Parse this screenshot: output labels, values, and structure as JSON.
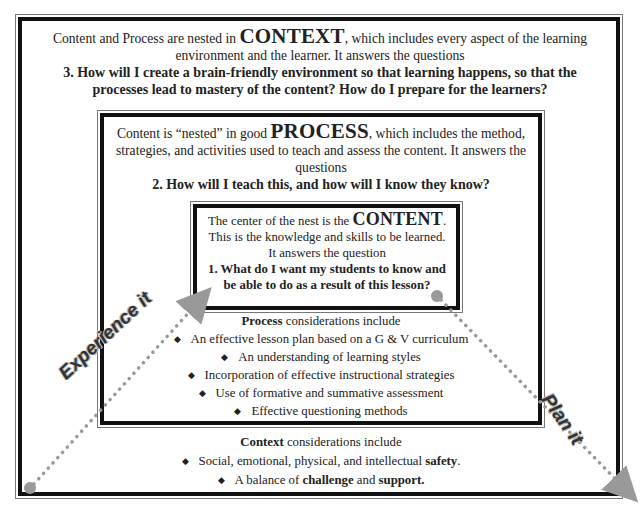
{
  "context_box": {
    "intro_pre": "Content and Process are nested in ",
    "keyword": "CONTEXT",
    "intro_post": ", which includes every aspect of the learning environment and the learner. It answers the questions",
    "question": "3. How will I create a brain-friendly environment so that learning happens, so that the processes lead to mastery of the content? How do I prepare for the learners?",
    "considerations_keyword": "Context",
    "considerations_label": " considerations include",
    "items": [
      {
        "pre": "Social, emotional, physical, and intellectual ",
        "bold": "safety",
        "post": "."
      },
      {
        "pre": "A balance of ",
        "bold": "challenge",
        "mid": " and ",
        "bold2": "support."
      }
    ]
  },
  "process_box": {
    "intro_pre": "Content is “nested” in good ",
    "keyword": "PROCESS",
    "intro_post": ", which includes the method, strategies, and activities used to teach and assess the content. It answers the questions",
    "question": "2. How will I teach this, and how will I know they know?",
    "considerations_keyword": "Process",
    "considerations_label": " considerations include",
    "items": [
      "An effective lesson plan based on a G & V curriculum",
      "An understanding of learning styles",
      "Incorporation of effective instructional strategies",
      "Use of formative and summative assessment",
      "Effective questioning methods"
    ]
  },
  "content_box": {
    "intro_pre": "The center of the nest is the ",
    "keyword": "CONTENT",
    "intro_post": ".",
    "line2": "This is the knowledge and skills to be learned.",
    "line3": "It answers the question",
    "question": "1. What do I want my students to know and be able to do as a result of this lesson?"
  },
  "arrows": {
    "experience_label": "Experience it",
    "plan_label": "Plan it",
    "color": "#999999"
  },
  "bullet_glyph": "◆"
}
